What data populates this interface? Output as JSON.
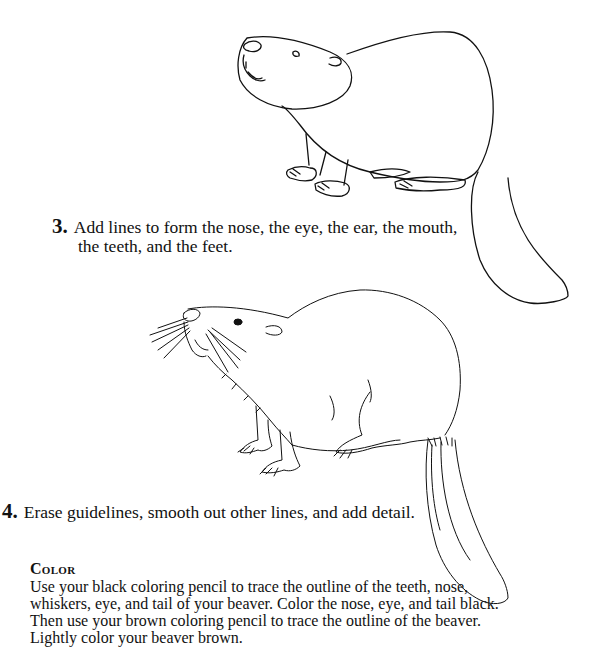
{
  "steps": [
    {
      "number": "3.",
      "text_line1": "Add lines to form the nose, the eye, the ear, the mouth,",
      "text_line2": "the teeth, and the feet.",
      "illustration": "beaver-outline-with-features"
    },
    {
      "number": "4.",
      "text": "Erase guidelines, smooth out other lines, and add detail.",
      "illustration": "beaver-detailed-drawing"
    }
  ],
  "color_section": {
    "heading": "Color",
    "body": "Use your black coloring pencil to trace the outline of the teeth, nose, whiskers, eye, and tail of your beaver.  Color the nose, eye, and tail black.  Then use your brown coloring pencil to trace the outline of the beaver.  Lightly color your beaver brown."
  }
}
